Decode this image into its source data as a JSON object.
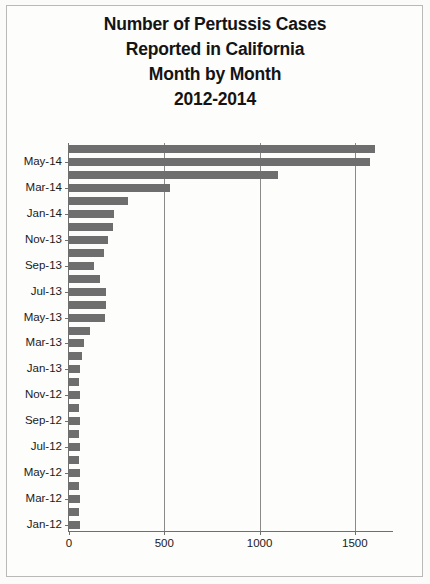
{
  "chart_data": {
    "type": "bar",
    "orientation": "horizontal",
    "title": "Number of Pertussis Cases Reported in California Month by Month 2012-2014",
    "title_lines": [
      "Number of Pertussis Cases",
      "Reported in California",
      "Month by Month",
      "2012-2014"
    ],
    "xlabel": "",
    "ylabel": "",
    "xlim": [
      0,
      1700
    ],
    "xticks": [
      0,
      500,
      1000,
      1500
    ],
    "xtick_labels": [
      "0",
      "500",
      "1000",
      "1500"
    ],
    "grid": true,
    "legend": "none",
    "ytick_labels": [
      "Jan-12",
      "Mar-12",
      "May-12",
      "Jul-12",
      "Sep-12",
      "Nov-12",
      "Jan-13",
      "Mar-13",
      "May-13",
      "Jul-13",
      "Sep-13",
      "Nov-13",
      "Jan-14",
      "Mar-14",
      "May-14"
    ],
    "categories": [
      "Jan-12",
      "Feb-12",
      "Mar-12",
      "Apr-12",
      "May-12",
      "Jun-12",
      "Jul-12",
      "Aug-12",
      "Sep-12",
      "Oct-12",
      "Nov-12",
      "Dec-12",
      "Jan-13",
      "Feb-13",
      "Mar-13",
      "Apr-13",
      "May-13",
      "Jun-13",
      "Jul-13",
      "Aug-13",
      "Sep-13",
      "Oct-13",
      "Nov-13",
      "Dec-13",
      "Jan-14",
      "Feb-14",
      "Mar-14",
      "Apr-14",
      "May-14",
      "Jun-14"
    ],
    "values": [
      60,
      50,
      60,
      55,
      60,
      55,
      60,
      55,
      60,
      55,
      60,
      55,
      60,
      70,
      80,
      110,
      190,
      195,
      195,
      165,
      130,
      185,
      205,
      230,
      235,
      310,
      530,
      1095,
      1580,
      1605
    ],
    "bar_color": "#6e6e6e"
  }
}
